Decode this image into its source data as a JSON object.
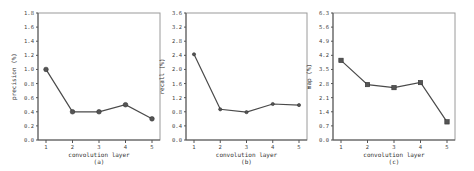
{
  "chart_data": [
    {
      "type": "line",
      "title": "",
      "subtitle": "(a)",
      "xlabel": "convolution layer",
      "ylabel": "precision (%)",
      "x": [
        1,
        2,
        3,
        4,
        5
      ],
      "values": [
        1.0,
        0.4,
        0.4,
        0.5,
        0.3
      ],
      "ylim": [
        0.0,
        1.8
      ],
      "yticks": [
        "0.0",
        "0.2",
        "0.4",
        "0.6",
        "0.8",
        "1.0",
        "1.2",
        "1.4",
        "1.6",
        "1.8"
      ],
      "xticks": [
        "1",
        "2",
        "3",
        "4",
        "5"
      ],
      "marker": "circle",
      "grid": false
    },
    {
      "type": "line",
      "title": "",
      "subtitle": "(b)",
      "xlabel": "convolution layer",
      "ylabel": "recall (%)",
      "x": [
        1,
        2,
        3,
        4,
        5
      ],
      "values": [
        2.43,
        0.87,
        0.79,
        1.02,
        0.99
      ],
      "ylim": [
        0.0,
        3.6
      ],
      "yticks": [
        "0.0",
        "0.4",
        "0.8",
        "1.2",
        "1.6",
        "2.0",
        "2.4",
        "2.8",
        "3.2",
        "3.6"
      ],
      "xticks": [
        "1",
        "2",
        "3",
        "4",
        "5"
      ],
      "marker": "star",
      "grid": false
    },
    {
      "type": "line",
      "title": "",
      "subtitle": "(c)",
      "xlabel": "convolution layer",
      "ylabel": "map (%)",
      "x": [
        1,
        2,
        3,
        4,
        5
      ],
      "values": [
        3.95,
        2.75,
        2.6,
        2.85,
        0.9
      ],
      "ylim": [
        0.0,
        6.3
      ],
      "yticks": [
        "0.0",
        "0.7",
        "1.4",
        "2.1",
        "2.8",
        "3.5",
        "4.2",
        "4.9",
        "5.6",
        "6.3"
      ],
      "xticks": [
        "1",
        "2",
        "3",
        "4",
        "5"
      ],
      "marker": "square",
      "grid": false
    }
  ]
}
